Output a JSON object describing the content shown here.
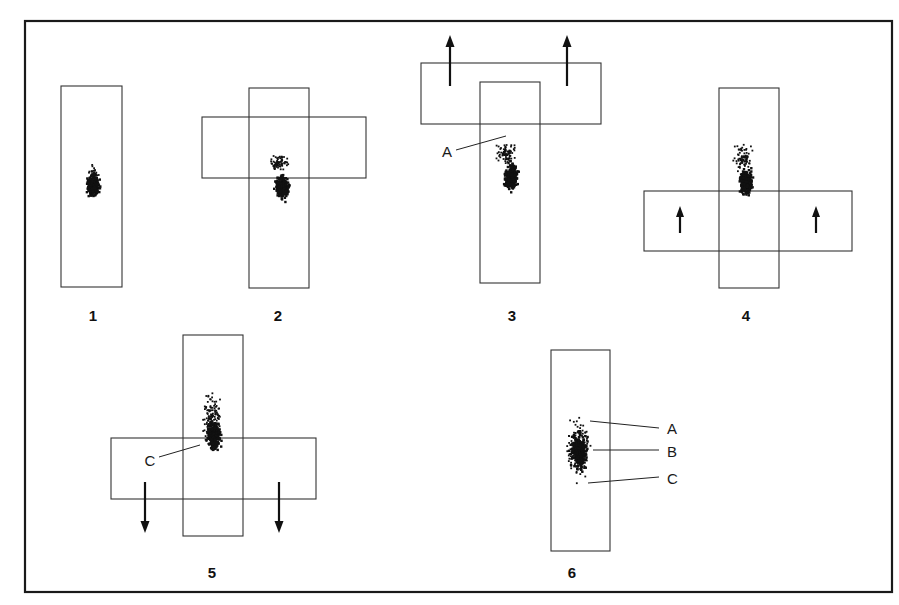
{
  "figure": {
    "colors": {
      "ink": "#111111",
      "outline": "#333333",
      "background": "#ffffff"
    },
    "panels": [
      {
        "number": "1",
        "layout": "vertical-strip"
      },
      {
        "number": "2",
        "layout": "cross",
        "overlay": "horizontal strip centered"
      },
      {
        "number": "3",
        "layout": "T",
        "overlay": "horizontal strip at top",
        "arrows": "up",
        "labels": [
          "A"
        ]
      },
      {
        "number": "4",
        "layout": "cross",
        "overlay": "horizontal strip lower",
        "arrows": "up"
      },
      {
        "number": "5",
        "layout": "cross",
        "overlay": "horizontal strip lower",
        "arrows": "down",
        "labels": [
          "C"
        ]
      },
      {
        "number": "6",
        "layout": "vertical-strip",
        "labels": [
          "A",
          "B",
          "C"
        ]
      }
    ],
    "labels": {
      "panel1": "1",
      "panel2": "2",
      "panel3": "3",
      "panel4": "4",
      "panel5": "5",
      "panel6": "6",
      "p3_A": "A",
      "p5_C": "C",
      "p6_A": "A",
      "p6_B": "B",
      "p6_C": "C"
    }
  }
}
